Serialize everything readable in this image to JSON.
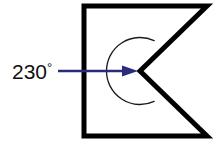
{
  "figure": {
    "angle_label": "230",
    "degree_symbol": "°",
    "angle_label_full": "230°",
    "colors": {
      "outline": "#000000",
      "arc": "#1a1a1a",
      "arrow": "#2b2b7c",
      "label_text": "#101010",
      "background": "#ffffff"
    },
    "shape": {
      "name": "concave-chevron-polygon",
      "description": "Rectangle with a V-notch cut into its right side forming a reflex interior angle",
      "stroke_width": 5,
      "points": "84,6 207,6 140,71 207,136 84,136",
      "vertex_reflex": {
        "x": 140,
        "y": 71
      }
    },
    "arc": {
      "name": "reflex-angle-arc",
      "center": {
        "x": 140,
        "y": 71
      },
      "radius": 33.5,
      "measure_degrees": 230,
      "stroke_width": 1.3,
      "path": "M 167.5 90.2 A 33.5 33.5 0 1 0 167.5 51.8"
    },
    "arrow": {
      "name": "angle-pointer-arrow",
      "from": {
        "x": 58,
        "y": 71
      },
      "to": {
        "x": 138,
        "y": 71
      },
      "stroke_width": 2.6,
      "head_length": 16,
      "head_width": 11
    },
    "label": {
      "x": 12,
      "y": 79,
      "anchor": "start"
    }
  }
}
